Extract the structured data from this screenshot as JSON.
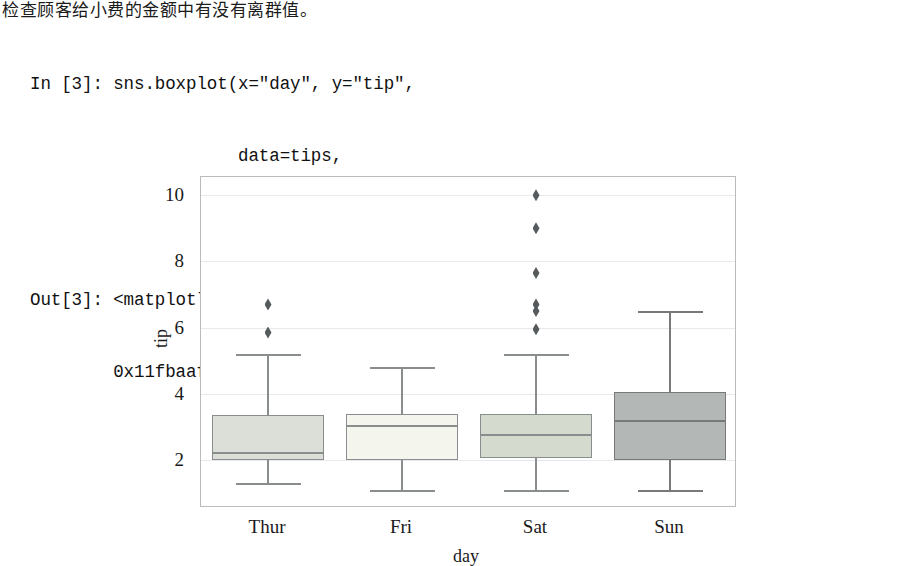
{
  "notebook": {
    "caption_cn": "检查顾客给小费的金额中有没有离群值。",
    "input_prompt": "In [3]: ",
    "output_prompt": "Out[3]: ",
    "code_lines": [
      "In [3]: sns.boxplot(x=\"day\", y=\"tip\",",
      "                    data=tips,",
      "                    palette=\"Set3\")",
      "Out[3]: <matplotlib.axes._subplots.AxesSubplot at",
      "        0x11fbaaf60>"
    ]
  },
  "chart_data": {
    "type": "box",
    "title": "",
    "xlabel": "day",
    "ylabel": "tip",
    "categories": [
      "Thur",
      "Fri",
      "Sat",
      "Sun"
    ],
    "xtick_labels": [
      "Thur",
      "Fri",
      "Sat",
      "Sun"
    ],
    "ytick_labels": [
      "2",
      "4",
      "6",
      "8",
      "10"
    ],
    "yticks": [
      2,
      4,
      6,
      8,
      10
    ],
    "ylim": [
      0.55,
      10.55
    ],
    "grid": true,
    "legend": "none",
    "palette": "Set3",
    "boxes": [
      {
        "category": "Thur",
        "whisker_low": 1.3,
        "q1": 2.0,
        "median": 2.25,
        "q3": 3.35,
        "whisker_high": 5.2,
        "outliers": [
          6.7,
          5.85
        ],
        "fill": "#dcdfd8",
        "edge": "#8a8d8e"
      },
      {
        "category": "Fri",
        "whisker_low": 1.1,
        "q1": 2.0,
        "median": 3.05,
        "q3": 3.4,
        "whisker_high": 4.8,
        "outliers": [],
        "fill": "#f4f6ee",
        "edge": "#8a8d8e"
      },
      {
        "category": "Sat",
        "whisker_low": 1.1,
        "q1": 2.05,
        "median": 2.8,
        "q3": 3.4,
        "whisker_high": 5.2,
        "outliers": [
          10.0,
          9.0,
          7.65,
          6.7,
          6.5,
          5.95
        ],
        "fill": "#d5dacf",
        "edge": "#8a8d8e"
      },
      {
        "category": "Sun",
        "whisker_low": 1.1,
        "q1": 2.0,
        "median": 3.2,
        "q3": 4.05,
        "whisker_high": 6.5,
        "outliers": [],
        "fill": "#b3b8b6",
        "edge": "#77797a"
      }
    ]
  }
}
